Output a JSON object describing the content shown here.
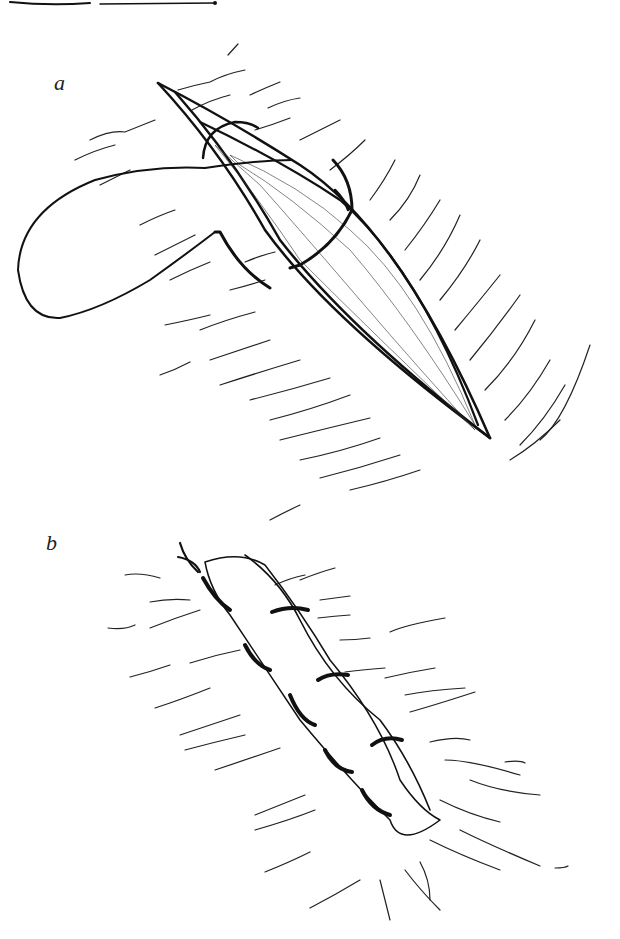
{
  "figure": {
    "panels": [
      {
        "label": "a",
        "content": "Open elliptical wound with a curved suture needle and looped thread passing through wound edges"
      },
      {
        "label": "b",
        "content": "Closed wound with a row of interrupted sutures, tied thread ends at top-left"
      }
    ],
    "colors": {
      "ink": "#111111",
      "background": "#ffffff"
    }
  }
}
